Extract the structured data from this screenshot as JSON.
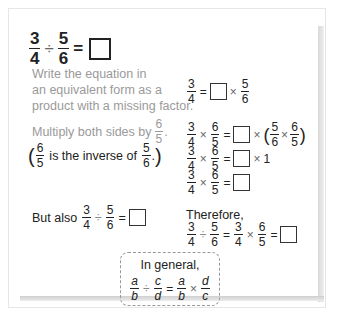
{
  "title": {
    "lhs_num": "3",
    "lhs_den": "4",
    "op": "÷",
    "rhs_num": "5",
    "rhs_den": "6",
    "equals": "="
  },
  "step1": {
    "text_lines": [
      "Write the equation in",
      "an equivalent form as a",
      "product with a missing factor."
    ],
    "eq": {
      "a_num": "3",
      "a_den": "4",
      "equals": "=",
      "times": "×",
      "b_num": "5",
      "b_den": "6"
    }
  },
  "step2": {
    "text": "Multiply both sides by",
    "by_num": "6",
    "by_den": "5",
    "period": ".",
    "note_pre": "is the inverse of",
    "note_num1": "6",
    "note_den1": "5",
    "note_num2": "5",
    "note_den2": "6",
    "note_period": ".",
    "eq_lines": [
      {
        "a_num": "3",
        "a_den": "4",
        "times": "×",
        "b_num": "6",
        "b_den": "5",
        "equals": "=",
        "tail": "× (5/6 × 6/5)"
      },
      {
        "a_num": "3",
        "a_den": "4",
        "times": "×",
        "b_num": "6",
        "b_den": "5",
        "equals": "=",
        "tail": "× 1"
      },
      {
        "a_num": "3",
        "a_den": "4",
        "times": "×",
        "b_num": "6",
        "b_den": "5",
        "equals": "="
      }
    ],
    "paren_inner": {
      "n1": "5",
      "d1": "6",
      "times": "×",
      "n2": "6",
      "d2": "5"
    },
    "one": "1"
  },
  "step3": {
    "label": "But also",
    "a_num": "3",
    "a_den": "4",
    "op": "÷",
    "b_num": "5",
    "b_den": "6",
    "equals": "=",
    "therefore": "Therefore,",
    "final": {
      "a_num": "3",
      "a_den": "4",
      "div": "÷",
      "b_num": "5",
      "b_den": "6",
      "eq1": "=",
      "c_num": "3",
      "c_den": "4",
      "times": "×",
      "d_num": "6",
      "d_den": "5",
      "eq2": "="
    }
  },
  "general": {
    "label": "In general,",
    "a": "a",
    "b": "b",
    "div": "÷",
    "c": "c",
    "d": "d",
    "equals": "=",
    "times": "×"
  },
  "colors": {
    "gray_text": "#9a9a9a",
    "dark_text": "#222222",
    "border": "#e6e6e6",
    "dashed": "#999999"
  }
}
